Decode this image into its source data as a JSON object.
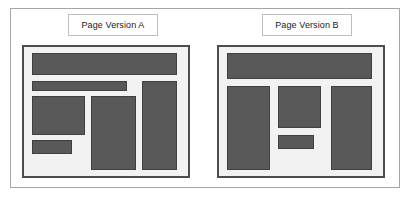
{
  "figure": {
    "type": "ab-test-wireframe-comparison",
    "background_color": "#ffffff",
    "frame_color": "#a6a6a6",
    "panel_border_color": "#4d4d4d",
    "panel_background_color": "#f2f2f2",
    "block_fill_color": "#595959",
    "block_border_color": "#3f3f3f",
    "label_border_color": "#bfbfbf"
  },
  "variants": [
    {
      "id": "a",
      "label": "Page Version A",
      "blocks": [
        {
          "name": "header-bar",
          "x": 5.0,
          "y": 5.0,
          "w": 88.0,
          "h": 17.0
        },
        {
          "name": "subheader-bar",
          "x": 5.0,
          "y": 26.0,
          "w": 58.0,
          "h": 8.5
        },
        {
          "name": "left-content-box",
          "x": 5.0,
          "y": 38.0,
          "w": 32.0,
          "h": 30.0
        },
        {
          "name": "left-small-box",
          "x": 5.0,
          "y": 72.0,
          "w": 24.0,
          "h": 11.0
        },
        {
          "name": "center-column-box",
          "x": 41.0,
          "y": 38.0,
          "w": 27.0,
          "h": 57.0
        },
        {
          "name": "right-column-box",
          "x": 72.0,
          "y": 26.0,
          "w": 21.0,
          "h": 69.0
        }
      ]
    },
    {
      "id": "b",
      "label": "Page Version B",
      "blocks": [
        {
          "name": "header-bar",
          "x": 5.0,
          "y": 5.0,
          "w": 88.0,
          "h": 20.0
        },
        {
          "name": "left-column-box",
          "x": 5.0,
          "y": 30.0,
          "w": 26.0,
          "h": 65.0
        },
        {
          "name": "center-content-box",
          "x": 36.0,
          "y": 30.0,
          "w": 26.0,
          "h": 33.0
        },
        {
          "name": "center-small-box",
          "x": 36.0,
          "y": 68.0,
          "w": 22.0,
          "h": 11.0
        },
        {
          "name": "right-column-box",
          "x": 68.0,
          "y": 30.0,
          "w": 25.0,
          "h": 65.0
        }
      ]
    }
  ]
}
